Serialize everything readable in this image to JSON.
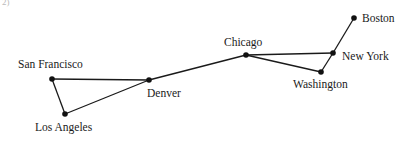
{
  "figure": {
    "label": "2)"
  },
  "graph": {
    "nodes": [
      {
        "id": "san-francisco",
        "name": "San Francisco",
        "x": 52,
        "y": 79,
        "label_x": 18,
        "label_y": 68
      },
      {
        "id": "los-angeles",
        "name": "Los Angeles",
        "x": 65,
        "y": 114,
        "label_x": 35,
        "label_y": 131
      },
      {
        "id": "denver",
        "name": "Denver",
        "x": 149,
        "y": 80,
        "label_x": 147,
        "label_y": 97
      },
      {
        "id": "chicago",
        "name": "Chicago",
        "x": 246,
        "y": 55,
        "label_x": 224,
        "label_y": 46
      },
      {
        "id": "new-york",
        "name": "New York",
        "x": 333,
        "y": 53,
        "label_x": 342,
        "label_y": 60
      },
      {
        "id": "washington",
        "name": "Washington",
        "x": 321,
        "y": 72,
        "label_x": 293,
        "label_y": 88
      },
      {
        "id": "boston",
        "name": "Boston",
        "x": 354,
        "y": 18,
        "label_x": 362,
        "label_y": 22
      }
    ],
    "edges": [
      {
        "from": "san-francisco",
        "to": "denver"
      },
      {
        "from": "san-francisco",
        "to": "los-angeles"
      },
      {
        "from": "los-angeles",
        "to": "denver"
      },
      {
        "from": "denver",
        "to": "chicago"
      },
      {
        "from": "chicago",
        "to": "new-york"
      },
      {
        "from": "chicago",
        "to": "washington"
      },
      {
        "from": "washington",
        "to": "new-york"
      },
      {
        "from": "new-york",
        "to": "boston"
      }
    ]
  }
}
